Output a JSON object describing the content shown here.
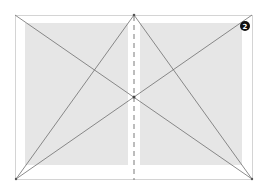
{
  "diagram": {
    "title": "",
    "badge": {
      "label": "2",
      "color": "#111111"
    },
    "colors": {
      "page_border": "#d4d4d4",
      "text_block": "#e6e6e6",
      "construction_line": "#6e6e6e",
      "spine_dash": "#7a7a7a",
      "background": "#ffffff"
    },
    "spread": {
      "x1": 15,
      "y1": 15,
      "x2": 253,
      "y2": 179,
      "spine_x": 134
    },
    "text_blocks": [
      {
        "name": "left-page-text-block",
        "x": 25,
        "y": 23,
        "w": 103,
        "h": 142
      },
      {
        "name": "right-page-text-block",
        "x": 140,
        "y": 23,
        "w": 102,
        "h": 142
      }
    ],
    "lines": [
      {
        "name": "diagonal-top-left-to-bottom-right",
        "x1": 15,
        "y1": 15,
        "x2": 252,
        "y2": 179
      },
      {
        "name": "diagonal-bottom-left-to-top-right",
        "x1": 16,
        "y1": 179,
        "x2": 252,
        "y2": 15
      },
      {
        "name": "apex-to-bottom-left",
        "x1": 134,
        "y1": 15,
        "x2": 16,
        "y2": 179
      },
      {
        "name": "apex-to-bottom-right",
        "x1": 134,
        "y1": 15,
        "x2": 252,
        "y2": 179
      }
    ],
    "points": [
      {
        "name": "apex-point",
        "x": 134,
        "y": 15
      },
      {
        "name": "center-intersection-point",
        "x": 134,
        "y": 97
      },
      {
        "name": "bottom-left-point",
        "x": 16,
        "y": 179
      },
      {
        "name": "bottom-right-point",
        "x": 252,
        "y": 179
      }
    ]
  }
}
